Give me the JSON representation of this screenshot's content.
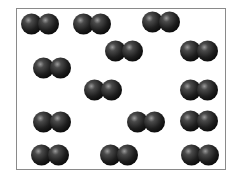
{
  "diagram": {
    "molecule_type": "diatomic",
    "molecule_count": 14,
    "atom_color": "#2a2a2a",
    "border_color": "#8a8a8a"
  }
}
